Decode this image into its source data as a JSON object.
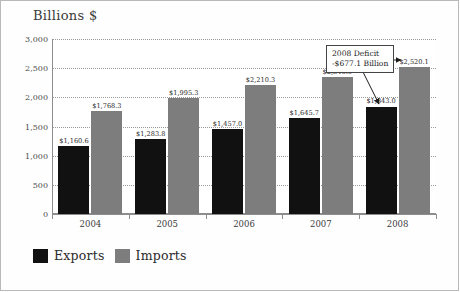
{
  "chart_data": {
    "type": "bar",
    "title": "Billions $",
    "xlabel": "",
    "ylabel": "Billions $",
    "ylim": [
      0,
      3000
    ],
    "ytick_labels": [
      "0",
      "500",
      "1,000",
      "1,500",
      "2,000",
      "2,500",
      "3,000"
    ],
    "ytick_values": [
      0,
      500,
      1000,
      1500,
      2000,
      2500,
      3000
    ],
    "grid": true,
    "legend_position": "bottom-left",
    "categories": [
      "2004",
      "2005",
      "2006",
      "2007",
      "2008"
    ],
    "series": [
      {
        "name": "Exports",
        "color": "#111111",
        "values": [
          1160.6,
          1283.8,
          1457.0,
          1645.7,
          1843.0
        ],
        "labels": [
          "$1,160.6",
          "$1,283.8",
          "$1,457.0",
          "$1,645.7",
          "$1,843.0"
        ]
      },
      {
        "name": "Imports",
        "color": "#7d7d7d",
        "values": [
          1768.3,
          1995.3,
          2210.3,
          2346.0,
          2520.1
        ],
        "labels": [
          "$1,768.3",
          "$1,995.3",
          "$2,210.3",
          "$2,346.0",
          "$2,520.1"
        ]
      }
    ],
    "annotations": [
      {
        "line1": "2008 Deficit",
        "line2": "-$677.1 Billion",
        "points_to": "2008 Exports bar"
      }
    ]
  },
  "legend": {
    "items": [
      {
        "label": "Exports",
        "swatch": "black-square-swatch"
      },
      {
        "label": "Imports",
        "swatch": "gray-square-swatch"
      }
    ]
  }
}
